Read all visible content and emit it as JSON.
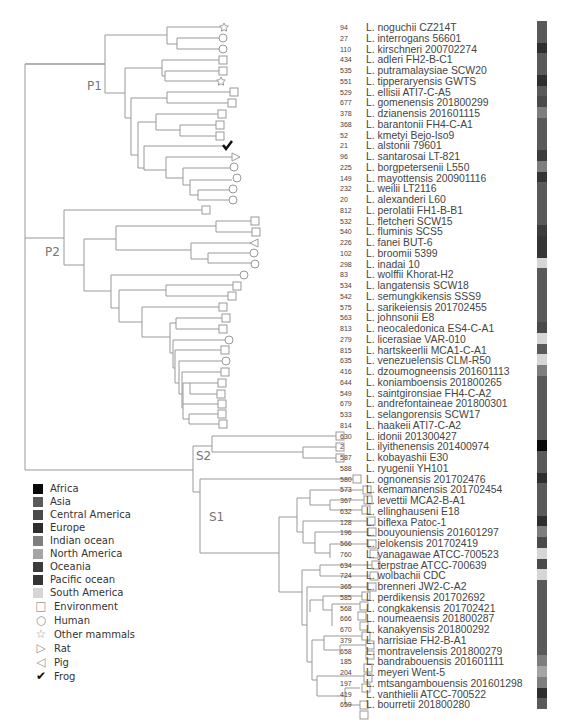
{
  "clades": {
    "p1": "P1",
    "p2": "P2",
    "s1": "S1",
    "s2": "S2"
  },
  "legend": {
    "regions": [
      {
        "label": "Africa",
        "color": "#0a0a0a"
      },
      {
        "label": "Asia",
        "color": "#5a5a5a"
      },
      {
        "label": "Central America",
        "color": "#4a4a4a"
      },
      {
        "label": "Europe",
        "color": "#2e2e2e"
      },
      {
        "label": "Indian ocean",
        "color": "#7e7e7e"
      },
      {
        "label": "North America",
        "color": "#a5a5a5"
      },
      {
        "label": "Oceania",
        "color": "#3c3c3c"
      },
      {
        "label": "Pacific ocean",
        "color": "#353535"
      },
      {
        "label": "South America",
        "color": "#d6d6d6"
      }
    ],
    "hosts": [
      {
        "label": "Environment",
        "icon": "square-icon",
        "glyph": "□"
      },
      {
        "label": "Human",
        "icon": "circle-icon",
        "glyph": "○"
      },
      {
        "label": "Other mammals",
        "icon": "star-icon",
        "glyph": "☆"
      },
      {
        "label": "Rat",
        "icon": "triangle-right-icon",
        "glyph": "▷"
      },
      {
        "label": "Pig",
        "icon": "triangle-left-icon",
        "glyph": "◁"
      },
      {
        "label": "Frog",
        "icon": "checkmark-icon",
        "glyph": "✔"
      }
    ]
  },
  "taxa": [
    {
      "num": "94",
      "name": "L. noguchii CZ214T",
      "host": "star",
      "color": "#5a5a5a"
    },
    {
      "num": "27",
      "name": "L. interrogans 56601",
      "host": "circle",
      "color": "#5a5a5a"
    },
    {
      "num": "110",
      "name": "L. kirschneri 200702274",
      "host": "circle",
      "color": "#2e2e2e"
    },
    {
      "num": "434",
      "name": "L. adleri FH2-B-C1",
      "host": "square",
      "color": "#5a5a5a"
    },
    {
      "num": "535",
      "name": "L. putramalaysiae SCW20",
      "host": "square",
      "color": "#5a5a5a"
    },
    {
      "num": "551",
      "name": "L. tipperaryensis GWTS",
      "host": "star",
      "color": "#2e2e2e"
    },
    {
      "num": "529",
      "name": "L. ellisii ATI7-C-A5",
      "host": "square",
      "color": "#5a5a5a"
    },
    {
      "num": "677",
      "name": "L. gomenensis 201800299",
      "host": "square",
      "color": "#4a4a4a"
    },
    {
      "num": "378",
      "name": "L. dzianensis 201601115",
      "host": "square",
      "color": "#7e7e7e"
    },
    {
      "num": "368",
      "name": "L. barantonii FH4-C-A1",
      "host": "square",
      "color": "#5a5a5a"
    },
    {
      "num": "52",
      "name": "L. kmetyi Bejo-Iso9",
      "host": "square",
      "color": "#5a5a5a"
    },
    {
      "num": "21",
      "name": "L. alstonii 79601",
      "host": "check",
      "color": "#5a5a5a"
    },
    {
      "num": "96",
      "name": "L. santarosai LT-821",
      "host": "rat",
      "color": "#3c3c3c"
    },
    {
      "num": "225",
      "name": "L. borgpetersenii L550",
      "host": "circle",
      "color": "#7e7e7e"
    },
    {
      "num": "149",
      "name": "L. mayottensis 200901116",
      "host": "circle",
      "color": "#353535"
    },
    {
      "num": "232",
      "name": "L. weilii LT2116",
      "host": "circle",
      "color": "#5a5a5a"
    },
    {
      "num": "20",
      "name": "L. alexanderi L60",
      "host": "circle",
      "color": "#5a5a5a"
    },
    {
      "num": "812",
      "name": "L. perolatii FH1-B-B1",
      "host": "square",
      "color": "#5a5a5a"
    },
    {
      "num": "532",
      "name": "L. fletcheri SCW15",
      "host": "square",
      "color": "#5a5a5a"
    },
    {
      "num": "540",
      "name": "L. fluminis SCS5",
      "host": "square",
      "color": "#3c3c3c"
    },
    {
      "num": "226",
      "name": "L. fanei BUT-6",
      "host": "pig",
      "color": "#353535"
    },
    {
      "num": "102",
      "name": "L. broomii 5399",
      "host": "circle",
      "color": "#353535"
    },
    {
      "num": "298",
      "name": "L. inadai 10",
      "host": "circle",
      "color": "#d6d6d6"
    },
    {
      "num": "83",
      "name": "L. wolffii Khorat-H2",
      "host": "circle",
      "color": "#5a5a5a"
    },
    {
      "num": "534",
      "name": "L. langatensis SCW18",
      "host": "square",
      "color": "#5a5a5a"
    },
    {
      "num": "542",
      "name": "L. semungkikensis SSS9",
      "host": "square",
      "color": "#5a5a5a"
    },
    {
      "num": "575",
      "name": "L. sarikeiensis 201702455",
      "host": "square",
      "color": "#5a5a5a"
    },
    {
      "num": "563",
      "name": "L. johnsonii E8",
      "host": "square",
      "color": "#5a5a5a"
    },
    {
      "num": "813",
      "name": "L. neocaledonica ES4-C-A1",
      "host": "square",
      "color": "#4a4a4a"
    },
    {
      "num": "279",
      "name": "L. licerasiae VAR-010",
      "host": "circle",
      "color": "#d6d6d6"
    },
    {
      "num": "815",
      "name": "L. hartskeerlii MCA1-C-A1",
      "host": "square",
      "color": "#5a5a5a"
    },
    {
      "num": "635",
      "name": "L. venezuelensis CLM-R50",
      "host": "circle",
      "color": "#d6d6d6"
    },
    {
      "num": "416",
      "name": "L. dzoumogneensis 201601113",
      "host": "square",
      "color": "#7e7e7e"
    },
    {
      "num": "644",
      "name": "L. koniamboensis 201800265",
      "host": "square",
      "color": "#5a5a5a"
    },
    {
      "num": "549",
      "name": "L. saintgironsiae FH4-C-A2",
      "host": "square",
      "color": "#5a5a5a"
    },
    {
      "num": "679",
      "name": "L. andrefontaineae 201800301",
      "host": "square",
      "color": "#5a5a5a"
    },
    {
      "num": "533",
      "name": "L. selangorensis SCW17",
      "host": "square",
      "color": "#5a5a5a"
    },
    {
      "num": "814",
      "name": "L. haakeii ATI7-C-A2",
      "host": "square",
      "color": "#5a5a5a"
    },
    {
      "num": "630",
      "name": "L. idonii 201300427",
      "host": "square",
      "color": "#5a5a5a"
    },
    {
      "num": "2",
      "name": "L. ilyithenensis 201400974",
      "host": "square",
      "color": "#0a0a0a"
    },
    {
      "num": "587",
      "name": "L. kobayashii E30",
      "host": "square",
      "color": "#5a5a5a"
    },
    {
      "num": "588",
      "name": "L. ryugenii YH101",
      "host": "square",
      "color": "#5a5a5a"
    },
    {
      "num": "580",
      "name": "L. ognonensis 201702476",
      "host": "square",
      "color": "#2e2e2e"
    },
    {
      "num": "573",
      "name": "L. kemamanensis 201702454",
      "host": "square",
      "color": "#5a5a5a"
    },
    {
      "num": "367",
      "name": "L. levettii MCA2-B-A1",
      "host": "square",
      "color": "#5a5a5a"
    },
    {
      "num": "632",
      "name": "L. ellinghauseni E18",
      "host": "square",
      "color": "#5a5a5a"
    },
    {
      "num": "128",
      "name": "L. biflexa Patoc-1",
      "host": "square",
      "color": "#2e2e2e"
    },
    {
      "num": "196",
      "name": "L. bouyouniensis 201601297",
      "host": "square",
      "color": "#7e7e7e"
    },
    {
      "num": "566",
      "name": "L. jelokensis 201702419",
      "host": "square",
      "color": "#4a4a4a"
    },
    {
      "num": "760",
      "name": "L. yanagawae ATCC-700523",
      "host": "square",
      "color": "#d6d6d6"
    },
    {
      "num": "634",
      "name": "L. terpstrae ATCC-700639",
      "host": "square",
      "color": "#4a4a4a"
    },
    {
      "num": "724",
      "name": "L. wolbachii CDC",
      "host": "square",
      "color": "#d6d6d6"
    },
    {
      "num": "365",
      "name": "L. brenneri JW2-C-A2",
      "host": "square",
      "color": "#5a5a5a"
    },
    {
      "num": "585",
      "name": "L. perdikensis 201702692",
      "host": "square",
      "color": "#5a5a5a"
    },
    {
      "num": "568",
      "name": "L. congkakensis 201702421",
      "host": "square",
      "color": "#5a5a5a"
    },
    {
      "num": "666",
      "name": "L. noumeaensis 201800287",
      "host": "square",
      "color": "#5a5a5a"
    },
    {
      "num": "670",
      "name": "L. kanakyensis 201800292",
      "host": "square",
      "color": "#5a5a5a"
    },
    {
      "num": "379",
      "name": "L. harrisiae FH2-B-A1",
      "host": "square",
      "color": "#5a5a5a"
    },
    {
      "num": "658",
      "name": "L. montravelensis 201800279",
      "host": "square",
      "color": "#5a5a5a"
    },
    {
      "num": "185",
      "name": "L. bandrabouensis 201601111",
      "host": "square",
      "color": "#7e7e7e"
    },
    {
      "num": "204",
      "name": "L. meyeri Went-5",
      "host": "square",
      "color": "#a5a5a5"
    },
    {
      "num": "197",
      "name": "L. mtsangambouensis 201601298",
      "host": "square",
      "color": "#7e7e7e"
    },
    {
      "num": "419",
      "name": "L. vanthielii ATCC-700522",
      "host": "square",
      "color": "#2e2e2e"
    },
    {
      "num": "659",
      "name": "L. bourretii 201800280",
      "host": "square",
      "color": "#5a5a5a"
    }
  ]
}
